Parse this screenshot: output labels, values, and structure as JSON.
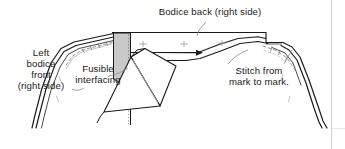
{
  "figure": {
    "kind": "sewing-construction-diagram",
    "width": 345,
    "height": 149,
    "background_color": "#ffffff",
    "line_color": "#1a1a1a",
    "interfacing_fill": "#c9c9c9",
    "stitch_color": "#8d8d8d",
    "border_color": "#cccccc"
  },
  "labels": {
    "bodice_back": "Bodice back (right side)",
    "left_bodice_front": "Left\nbodice\nfront\n(right side)",
    "fusible_interfacing": "Fusible\ninterfacing",
    "stitch_from_mark": "Stitch from\nmark to mark."
  },
  "icons": {
    "leader_line": "leader-line-icon",
    "arrow": "arrow-icon",
    "stitch_dashes": "stitch-dashes-icon",
    "mark_cross": "mark-cross-icon"
  }
}
